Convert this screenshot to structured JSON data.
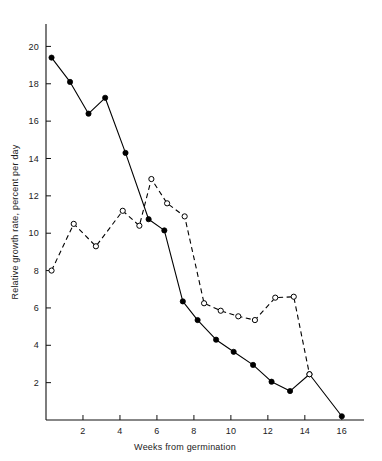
{
  "chart_data": {
    "type": "line",
    "title": "",
    "xlabel": "Weeks from germination",
    "ylabel": "Relative growth rate, percent per day",
    "xlim": [
      0,
      17.2
    ],
    "ylim": [
      0,
      21.2
    ],
    "xticks": [
      2,
      4,
      6,
      8,
      10,
      12,
      14,
      16
    ],
    "xtick_labels": [
      "2",
      "4",
      "6",
      "8",
      "10",
      "12",
      "14",
      "16"
    ],
    "yticks": [
      2,
      4,
      6,
      8,
      10,
      12,
      14,
      16,
      18,
      20
    ],
    "ytick_labels": [
      "2",
      "4",
      "6",
      "8",
      "10",
      "12",
      "14",
      "16",
      "18",
      "20"
    ],
    "grid": false,
    "legend": "none",
    "series": [
      {
        "name": "filled-circle-solid-line",
        "marker": "filled-circle",
        "linestyle": "solid",
        "color": "#000000",
        "points": [
          [
            0.3,
            19.4
          ],
          [
            1.3,
            18.1
          ],
          [
            2.3,
            16.4
          ],
          [
            3.2,
            17.25
          ],
          [
            4.3,
            14.3
          ],
          [
            5.55,
            10.75
          ],
          [
            6.4,
            10.15
          ],
          [
            7.4,
            6.35
          ],
          [
            8.2,
            5.35
          ],
          [
            9.2,
            4.3
          ],
          [
            10.15,
            3.65
          ],
          [
            11.2,
            2.95
          ],
          [
            12.2,
            2.05
          ],
          [
            13.2,
            1.55
          ],
          [
            14.25,
            2.45
          ],
          [
            16.0,
            0.2
          ]
        ]
      },
      {
        "name": "open-circle-dashed-line",
        "marker": "open-circle",
        "linestyle": "dashed",
        "color": "#000000",
        "points": [
          [
            0.3,
            8.0
          ],
          [
            1.5,
            10.5
          ],
          [
            2.7,
            9.3
          ],
          [
            4.15,
            11.2
          ],
          [
            5.05,
            10.4
          ],
          [
            5.7,
            12.9
          ],
          [
            6.55,
            11.6
          ],
          [
            7.5,
            10.9
          ],
          [
            8.55,
            6.25
          ],
          [
            9.45,
            5.85
          ],
          [
            10.4,
            5.55
          ],
          [
            11.3,
            5.35
          ],
          [
            12.4,
            6.55
          ],
          [
            13.4,
            6.6
          ],
          [
            14.25,
            2.45
          ]
        ]
      }
    ]
  }
}
